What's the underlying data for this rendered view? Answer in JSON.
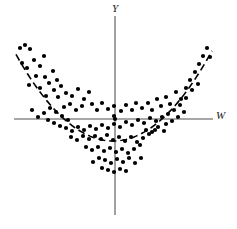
{
  "figure": {
    "background_color": "#ffffff",
    "ink_color": "#000000",
    "axis_color": "#808080"
  },
  "axes": {
    "vertical": {
      "name": "Y",
      "label": "Y",
      "x": 115,
      "y_top": 16,
      "y_bottom": 215,
      "width": 1.6,
      "color": "#8a8a8a"
    },
    "horizontal": {
      "name": "W",
      "label": "W",
      "y": 119,
      "x_left": 14,
      "x_right": 213,
      "width": 1.6,
      "color": "#8a8a8a"
    },
    "origin": {
      "x": 115,
      "y": 119
    }
  },
  "chart_data": {
    "type": "scatter",
    "title": "",
    "xlabel": "W",
    "ylabel": "Y",
    "grid": false,
    "legend": null,
    "axis_style": "crossed-at-origin",
    "origin_pixel": {
      "x": 115,
      "y": 119
    },
    "xlim_pixel": [
      14,
      213
    ],
    "ylim_pixel": [
      16,
      215
    ],
    "marker": {
      "shape": "circle",
      "filled": true,
      "color": "#000000",
      "radius": 2.1
    },
    "fit_curve": {
      "name": "quadratic-trend-line",
      "style": "dashed",
      "color": "#000000",
      "width": 1.6,
      "dash": "7,4",
      "form": "parabola",
      "vertex_pixel": {
        "x": 113,
        "y": 141
      },
      "curvature_a": 0.0092,
      "x_start_pixel": 16,
      "x_end_pixel": 212
    },
    "points_pixel": [
      [
        20,
        48
      ],
      [
        25,
        45
      ],
      [
        30,
        49
      ],
      [
        22,
        63
      ],
      [
        27,
        68
      ],
      [
        34,
        60
      ],
      [
        40,
        66
      ],
      [
        44,
        56
      ],
      [
        36,
        76
      ],
      [
        45,
        77
      ],
      [
        29,
        85
      ],
      [
        40,
        88
      ],
      [
        49,
        83
      ],
      [
        53,
        71
      ],
      [
        57,
        80
      ],
      [
        54,
        90
      ],
      [
        61,
        86
      ],
      [
        46,
        96
      ],
      [
        58,
        97
      ],
      [
        66,
        93
      ],
      [
        72,
        96
      ],
      [
        78,
        89
      ],
      [
        84,
        99
      ],
      [
        89,
        92
      ],
      [
        64,
        107
      ],
      [
        70,
        104
      ],
      [
        76,
        110
      ],
      [
        82,
        106
      ],
      [
        92,
        104
      ],
      [
        97,
        110
      ],
      [
        102,
        103
      ],
      [
        108,
        109
      ],
      [
        114,
        106
      ],
      [
        114,
        116
      ],
      [
        121,
        111
      ],
      [
        126,
        105
      ],
      [
        132,
        110
      ],
      [
        136,
        103
      ],
      [
        142,
        108
      ],
      [
        148,
        103
      ],
      [
        152,
        110
      ],
      [
        157,
        99
      ],
      [
        161,
        106
      ],
      [
        166,
        97
      ],
      [
        170,
        104
      ],
      [
        176,
        92
      ],
      [
        181,
        99
      ],
      [
        186,
        88
      ],
      [
        190,
        80
      ],
      [
        195,
        72
      ],
      [
        199,
        64
      ],
      [
        203,
        56
      ],
      [
        207,
        48
      ],
      [
        210,
        57
      ],
      [
        198,
        84
      ],
      [
        192,
        90
      ],
      [
        186,
        98
      ],
      [
        180,
        105
      ],
      [
        174,
        110
      ],
      [
        168,
        114
      ],
      [
        162,
        117
      ],
      [
        156,
        121
      ],
      [
        150,
        118
      ],
      [
        144,
        123
      ],
      [
        138,
        120
      ],
      [
        132,
        125
      ],
      [
        126,
        122
      ],
      [
        120,
        127
      ],
      [
        114,
        124
      ],
      [
        108,
        128
      ],
      [
        102,
        125
      ],
      [
        96,
        129
      ],
      [
        90,
        126
      ],
      [
        84,
        130
      ],
      [
        78,
        127
      ],
      [
        72,
        131
      ],
      [
        66,
        128
      ],
      [
        60,
        126
      ],
      [
        54,
        123
      ],
      [
        48,
        120
      ],
      [
        95,
        136
      ],
      [
        101,
        139
      ],
      [
        107,
        135
      ],
      [
        113,
        140
      ],
      [
        119,
        137
      ],
      [
        125,
        141
      ],
      [
        131,
        137
      ],
      [
        137,
        142
      ],
      [
        143,
        138
      ],
      [
        149,
        134
      ],
      [
        155,
        130
      ],
      [
        89,
        139
      ],
      [
        83,
        136
      ],
      [
        77,
        140
      ],
      [
        71,
        137
      ],
      [
        98,
        147
      ],
      [
        104,
        151
      ],
      [
        110,
        148
      ],
      [
        116,
        152
      ],
      [
        122,
        149
      ],
      [
        128,
        153
      ],
      [
        134,
        149
      ],
      [
        140,
        145
      ],
      [
        92,
        150
      ],
      [
        86,
        147
      ],
      [
        105,
        160
      ],
      [
        111,
        163
      ],
      [
        117,
        159
      ],
      [
        123,
        162
      ],
      [
        129,
        158
      ],
      [
        99,
        158
      ],
      [
        93,
        162
      ],
      [
        135,
        163
      ],
      [
        141,
        158
      ],
      [
        108,
        170
      ],
      [
        114,
        172
      ],
      [
        120,
        169
      ],
      [
        126,
        171
      ],
      [
        102,
        168
      ],
      [
        115,
        119
      ],
      [
        166,
        124
      ],
      [
        172,
        121
      ],
      [
        178,
        117
      ],
      [
        184,
        112
      ],
      [
        158,
        127
      ],
      [
        164,
        131
      ],
      [
        152,
        132
      ],
      [
        146,
        130
      ],
      [
        68,
        120
      ],
      [
        62,
        116
      ],
      [
        56,
        112
      ],
      [
        50,
        108
      ],
      [
        44,
        113
      ],
      [
        38,
        117
      ],
      [
        32,
        110
      ]
    ]
  },
  "labels": {
    "y_axis_label": "Y",
    "x_axis_label": "W"
  }
}
